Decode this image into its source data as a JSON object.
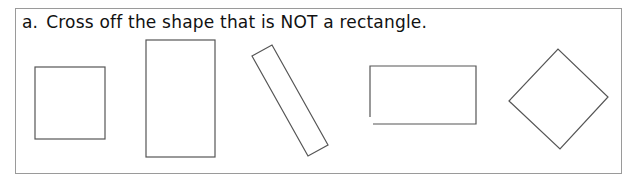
{
  "question": {
    "label": "a.",
    "text": "Cross off the shape that is NOT a rectangle."
  },
  "shapes": [
    {
      "name": "square",
      "is_rectangle": true
    },
    {
      "name": "tall-rectangle",
      "is_rectangle": true
    },
    {
      "name": "tilted-rectangle",
      "is_rectangle": true
    },
    {
      "name": "open-rectangle",
      "is_rectangle": false
    },
    {
      "name": "diamond-square",
      "is_rectangle": true
    }
  ],
  "colors": {
    "stroke": "#555555",
    "border": "#9a9a9a",
    "text": "#111111"
  }
}
